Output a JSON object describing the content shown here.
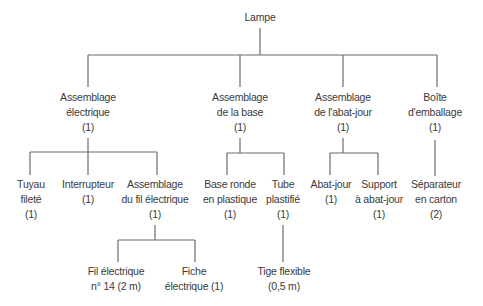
{
  "diagram": {
    "type": "bill-of-materials-tree",
    "root": {
      "id": "lampe",
      "lines": [
        "Lampe"
      ]
    },
    "level1": [
      {
        "id": "assemblage-electrique",
        "lines": [
          "Assemblage",
          "électrique",
          "(1)"
        ]
      },
      {
        "id": "assemblage-base",
        "lines": [
          "Assemblage",
          "de la base",
          "(1)"
        ]
      },
      {
        "id": "assemblage-abat-jour",
        "lines": [
          "Assemblage",
          "de l'abat-jour",
          "(1)"
        ]
      },
      {
        "id": "boite-emballage",
        "lines": [
          "Boîte",
          "d'emballage",
          "(1)"
        ]
      }
    ],
    "level2": [
      {
        "id": "tuyau-filete",
        "parent": "assemblage-electrique",
        "lines": [
          "Tuyau",
          "fileté",
          "(1)"
        ]
      },
      {
        "id": "interrupteur",
        "parent": "assemblage-electrique",
        "lines": [
          "Interrupteur",
          "(1)"
        ]
      },
      {
        "id": "assemblage-fil",
        "parent": "assemblage-electrique",
        "lines": [
          "Assemblage",
          "du fil électrique",
          "(1)"
        ]
      },
      {
        "id": "base-ronde",
        "parent": "assemblage-base",
        "lines": [
          "Base ronde",
          "en plastique",
          "(1)"
        ]
      },
      {
        "id": "tube-plastifie",
        "parent": "assemblage-base",
        "lines": [
          "Tube",
          "plastifié",
          "(1)"
        ]
      },
      {
        "id": "abat-jour",
        "parent": "assemblage-abat-jour",
        "lines": [
          "Abat-jour",
          "(1)"
        ]
      },
      {
        "id": "support-abat-jour",
        "parent": "assemblage-abat-jour",
        "lines": [
          "Support",
          "à abat-jour",
          "(1)"
        ]
      },
      {
        "id": "separateur",
        "parent": "boite-emballage",
        "lines": [
          "Séparateur",
          "en carton",
          "(2)"
        ]
      }
    ],
    "level3": [
      {
        "id": "fil-electrique",
        "parent": "assemblage-fil",
        "lines": [
          "Fil électrique",
          "n° 14 (2 m)"
        ]
      },
      {
        "id": "fiche-electrique",
        "parent": "assemblage-fil",
        "lines": [
          "Fiche",
          "électrique (1)"
        ]
      },
      {
        "id": "tige-flexible",
        "parent": "tube-plastifie",
        "lines": [
          "Tige flexible",
          "(0,5 m)"
        ]
      }
    ],
    "line_color": "#6b6b6b",
    "text_color": "#3a3a3a"
  }
}
